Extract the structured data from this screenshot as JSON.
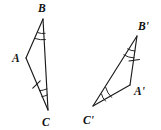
{
  "figure": {
    "background_color": "#ffffff",
    "stroke_color": "#1a1a1a",
    "label_color": "#111111"
  },
  "triangles": [
    {
      "name": "triangle-abc",
      "vertices": [
        {
          "id": "A",
          "label": "A",
          "x": 26,
          "y": 58,
          "label_x": 12,
          "label_y": 62
        },
        {
          "id": "B",
          "label": "B",
          "x": 43,
          "y": 19,
          "label_x": 38,
          "label_y": 12
        },
        {
          "id": "C",
          "label": "C",
          "x": 48,
          "y": 110,
          "label_x": 42,
          "label_y": 126
        }
      ],
      "marks": {
        "double_arc_vertices": [
          "B",
          "C"
        ],
        "single_tick_side": "AC"
      }
    },
    {
      "name": "triangle-a-prime-b-prime-c-prime",
      "vertices": [
        {
          "id": "A'",
          "label": "A'",
          "x": 130,
          "y": 85,
          "label_x": 134,
          "label_y": 95
        },
        {
          "id": "B'",
          "label": "B'",
          "x": 137,
          "y": 36,
          "label_x": 138,
          "label_y": 30
        },
        {
          "id": "C'",
          "label": "C'",
          "x": 93,
          "y": 106,
          "label_x": 84,
          "label_y": 124
        }
      ],
      "marks": {
        "double_arc_vertices": [
          "B'",
          "C'"
        ],
        "single_tick_side": "A'B'"
      }
    }
  ]
}
